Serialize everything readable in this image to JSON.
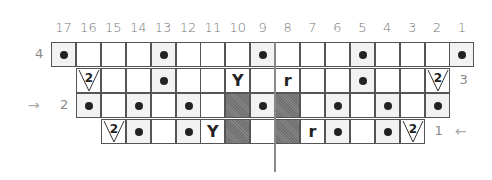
{
  "chart": {
    "columns": [
      "17",
      "16",
      "15",
      "14",
      "13",
      "12",
      "11",
      "10",
      "9",
      "8",
      "7",
      "6",
      "5",
      "4",
      "3",
      "2",
      "1"
    ],
    "rows": [
      {
        "label": "4",
        "side": "left",
        "start_col": 17,
        "cells": [
          "dot",
          "",
          "",
          "",
          "dot",
          "",
          "",
          "",
          "dot",
          "",
          "",
          "",
          "dot",
          "",
          "",
          "",
          "dot"
        ]
      },
      {
        "label": "3",
        "side": "right",
        "start_col": 16,
        "cells": [
          "dec2",
          "",
          "",
          "dot",
          "",
          "",
          "lean-left",
          "",
          "lean-right",
          "",
          "",
          "dot",
          "",
          "",
          "dec2"
        ]
      },
      {
        "label": "2",
        "side": "left",
        "start_col": 16,
        "cells": [
          "dot",
          "",
          "dot",
          "",
          "dot",
          "",
          "gray",
          "dot",
          "gray",
          "",
          "dot",
          "",
          "dot",
          "",
          "dot"
        ]
      },
      {
        "label": "1",
        "side": "right",
        "start_col": 15,
        "cells": [
          "dec2",
          "dot",
          "",
          "dot",
          "lean-left",
          "gray",
          "",
          "gray",
          "lean-right",
          "dot",
          "",
          "dot",
          "dec2"
        ]
      }
    ],
    "symbols": {
      "dec2": "2",
      "lean-left": "Y",
      "lean-right": "r"
    },
    "arrows": {
      "row2": "→",
      "row1": "←"
    }
  }
}
